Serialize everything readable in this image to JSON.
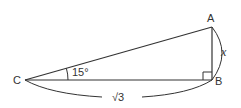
{
  "diagram": {
    "type": "right-triangle",
    "vertices": {
      "A": {
        "label": "A"
      },
      "B": {
        "label": "B"
      },
      "C": {
        "label": "C"
      }
    },
    "angle_C": {
      "label": "15°"
    },
    "right_angle_at": "B",
    "side_AB": {
      "label": "x"
    },
    "side_CB": {
      "label": "√3"
    },
    "stroke_color": "#333333"
  }
}
